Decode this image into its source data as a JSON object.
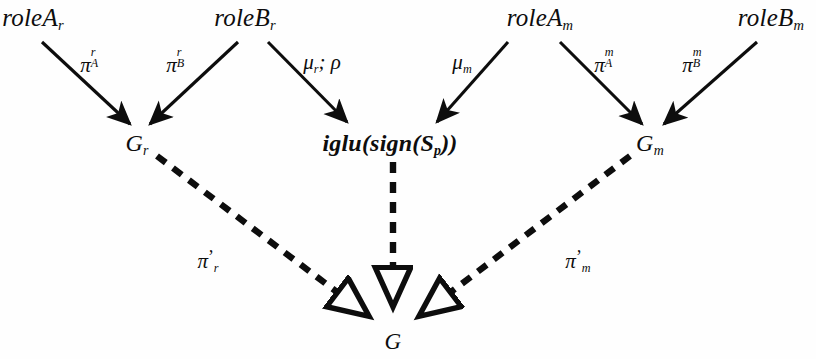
{
  "figure": {
    "kind": "directed-graph-diagram",
    "background_color": "#fefefe",
    "ink_color": "#0d0d0d",
    "width": 816,
    "height": 359
  },
  "nodes": {
    "role_a_r": {
      "text": "roleA",
      "sub": "r",
      "x": 33,
      "y": 17
    },
    "role_b_r": {
      "text": "roleB",
      "sub": "r",
      "x": 245,
      "y": 17
    },
    "role_a_m": {
      "text": "roleA",
      "sub": "m",
      "x": 540,
      "y": 17
    },
    "role_b_m": {
      "text": "roleB",
      "sub": "m",
      "x": 771,
      "y": 17
    },
    "g_r": {
      "text": "G",
      "sub": "r",
      "x": 137,
      "y": 143
    },
    "iglu": {
      "text_bold_a": "iglu(",
      "text_bold_b": "sign",
      "text_c": "(S",
      "sub": "p",
      "text_d": "))",
      "full_text": "iglu(sign(S_p))",
      "x": 390,
      "y": 143
    },
    "g_m": {
      "text": "G",
      "sub": "m",
      "x": 650,
      "y": 143
    },
    "g_final": {
      "text": "G",
      "x": 393,
      "y": 341
    }
  },
  "edges": {
    "solid": [
      {
        "name": "roleA_r-to-G_r",
        "label_base": "π",
        "label_sup": "r",
        "label_sub": "A",
        "label_x": 92,
        "label_y": 63,
        "x1": 42,
        "y1": 42,
        "x2": 130,
        "y2": 124
      },
      {
        "name": "roleB_r-to-G_r",
        "label_base": "π",
        "label_sup": "r",
        "label_sub": "B",
        "label_x": 178,
        "label_y": 63,
        "x1": 238,
        "y1": 42,
        "x2": 150,
        "y2": 124
      },
      {
        "name": "roleB_r-to-iglu",
        "label_base": "μ",
        "label_sub": "r",
        "label_extra": "; ρ",
        "label_x": 322,
        "label_y": 62,
        "x1": 268,
        "y1": 42,
        "x2": 347,
        "y2": 122
      },
      {
        "name": "roleA_m-to-iglu",
        "label_base": "μ",
        "label_sub": "m",
        "label_x": 462,
        "label_y": 62,
        "x1": 508,
        "y1": 42,
        "x2": 437,
        "y2": 122
      },
      {
        "name": "roleA_m-to-G_m",
        "label_base": "π",
        "label_sup": "m",
        "label_sub": "A",
        "label_x": 606,
        "label_y": 63,
        "x1": 560,
        "y1": 42,
        "x2": 642,
        "y2": 124
      },
      {
        "name": "roleB_m-to-G_m",
        "label_base": "π",
        "label_sup": "m",
        "label_sub": "B",
        "label_x": 694,
        "label_y": 63,
        "x1": 757,
        "y1": 42,
        "x2": 664,
        "y2": 124
      }
    ],
    "dashed": [
      {
        "name": "G_r-to-G",
        "label_base": "π",
        "label_prime": "’",
        "label_sub": "r",
        "label_x": 208,
        "label_y": 261,
        "x1": 157,
        "y1": 156,
        "x2": 366,
        "y2": 314
      },
      {
        "name": "iglu-to-G",
        "x1": 393,
        "y1": 162,
        "x2": 393,
        "y2": 303
      },
      {
        "name": "G_m-to-G",
        "label_base": "π",
        "label_prime": "’",
        "label_sub": "m",
        "label_x": 578,
        "label_y": 261,
        "x1": 630,
        "y1": 156,
        "x2": 422,
        "y2": 314
      }
    ]
  }
}
